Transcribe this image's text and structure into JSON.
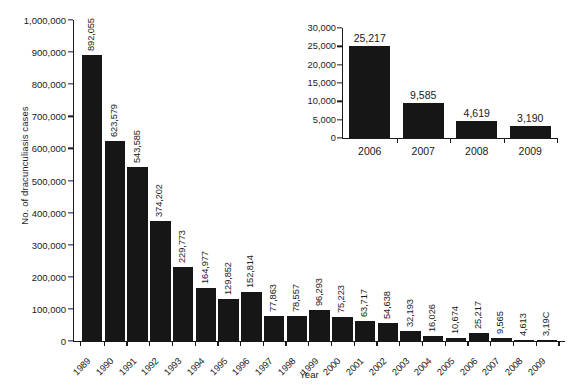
{
  "chart_data": [
    {
      "id": "main",
      "type": "bar",
      "title": "",
      "xlabel": "Year",
      "ylabel": "No. of dracunculiasis cases",
      "ylim": [
        0,
        1000000
      ],
      "ytick_values": [
        0,
        100000,
        200000,
        300000,
        400000,
        500000,
        600000,
        700000,
        800000,
        900000,
        1000000
      ],
      "ytick_labels": [
        "0",
        "100,000",
        "200,000",
        "300,000",
        "400,000",
        "500,000",
        "600,000",
        "700,000",
        "800,000",
        "900,000",
        "1,000,000"
      ],
      "grid": false,
      "legend": "none",
      "bar_color": "#161616",
      "categories": [
        "1989",
        "1990",
        "1991",
        "1992",
        "1993",
        "1994",
        "1995",
        "1996",
        "1997",
        "1998",
        "1999",
        "2000",
        "2001",
        "2002",
        "2003",
        "2004",
        "2005",
        "2006",
        "2007",
        "2008",
        "2009"
      ],
      "values": [
        892055,
        623579,
        543585,
        374202,
        229773,
        164977,
        129852,
        152814,
        77863,
        78557,
        96293,
        75223,
        63717,
        54638,
        32193,
        16026,
        10674,
        25217,
        9585,
        4619,
        3190
      ],
      "value_labels": [
        "892,055",
        "623,579",
        "543,585",
        "374,202",
        "229,773",
        "164,977",
        "129,852",
        "152,814",
        "77,863",
        "78,557",
        "96,293",
        "75,223",
        "63,717",
        "54,638",
        "32,193",
        "16,026",
        "10,674",
        "25,217",
        "9,565",
        "4,613",
        "3,19C"
      ]
    },
    {
      "id": "inset",
      "type": "bar",
      "title": "",
      "xlabel": "",
      "ylabel": "",
      "ylim": [
        0,
        30000
      ],
      "ytick_values": [
        0,
        5000,
        10000,
        15000,
        20000,
        25000,
        30000
      ],
      "ytick_labels": [
        "0",
        "5,000",
        "10,000",
        "15,000",
        "20,000",
        "25,000",
        "30,000"
      ],
      "grid": false,
      "legend": "none",
      "bar_color": "#161616",
      "categories": [
        "2006",
        "2007",
        "2008",
        "2009"
      ],
      "values": [
        25217,
        9585,
        4619,
        3190
      ],
      "value_labels": [
        "25,217",
        "9,585",
        "4,619",
        "3,190"
      ]
    }
  ]
}
